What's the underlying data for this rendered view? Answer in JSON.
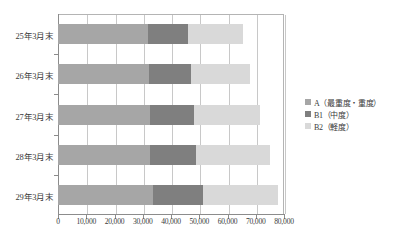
{
  "chart_data": {
    "type": "bar",
    "orientation": "horizontal",
    "stacked": true,
    "title": "",
    "xlabel": "",
    "ylabel": "",
    "categories": [
      "25年3月末",
      "26年3月末",
      "27年3月末",
      "28年3月末",
      "29年3月末"
    ],
    "series": [
      {
        "name": "A（最重度・重度）",
        "color": "#a6a6a6",
        "values": [
          32000,
          32200,
          32500,
          32700,
          33500
        ]
      },
      {
        "name": "B1（中度）",
        "color": "#7f7f7f",
        "values": [
          14000,
          14800,
          15500,
          16300,
          18000
        ]
      },
      {
        "name": "B2（軽度）",
        "color": "#d9d9d9",
        "values": [
          19500,
          21000,
          23500,
          26000,
          26500
        ]
      }
    ],
    "totals": [
      65500,
      68000,
      71500,
      75000,
      78000
    ],
    "xlim": [
      0,
      80000
    ],
    "xticks": [
      0,
      10000,
      20000,
      30000,
      40000,
      50000,
      60000,
      70000,
      80000
    ],
    "xtick_labels": [
      "0",
      "10,000",
      "20,000",
      "30,000",
      "40,000",
      "50,000",
      "60,000",
      "70,000",
      "80,000"
    ],
    "grid": "vertical",
    "legend_position": "right"
  },
  "legend": {
    "items": [
      {
        "label": "A（最重度・重度）",
        "color": "#a6a6a6"
      },
      {
        "label": "B1（中度）",
        "color": "#7f7f7f"
      },
      {
        "label": "B2（軽度）",
        "color": "#d9d9d9"
      }
    ]
  },
  "caption": {
    "text": ""
  }
}
